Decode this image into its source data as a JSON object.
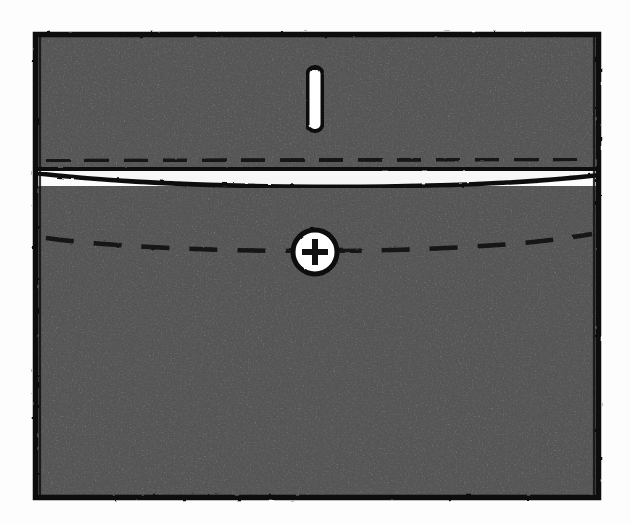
{
  "figure": {
    "title": "Sewing construction diagram: flap pocket with buttonhole and button",
    "style": "stippled line drawing",
    "background_color": "#fdfdfd",
    "ink_color": "#111111",
    "fabric_tone": "#b9b9b9",
    "highlight_color": "#f4f4f4"
  },
  "canvas": {
    "width": 631,
    "height": 523
  },
  "pocket": {
    "outline": {
      "label": "pocket-outline",
      "x": 33,
      "y": 32,
      "width": 568,
      "height": 468,
      "stroke_width": 5,
      "stroke_color": "#111111"
    },
    "flap": {
      "label": "pocket-flap",
      "top": 32,
      "fold_line_y": 170,
      "under_line_y": 192,
      "stitch_line_y": 160,
      "stroke_width": 4
    },
    "body": {
      "label": "pocket-body",
      "top": 192,
      "bottom": 500
    }
  },
  "stitching": {
    "left_seam": {
      "label": "left-edge-stitch-line",
      "x": 53,
      "y_start": 44,
      "y_end": 490,
      "dash": "16 13",
      "stroke_width": 4
    },
    "right_seam": {
      "label": "right-edge-stitch-line",
      "x": 581,
      "y_start": 44,
      "y_end": 490,
      "dash": "16 13",
      "stroke_width": 4
    },
    "flap_seam": {
      "label": "flap-stitch-line",
      "y": 160,
      "x_start": 44,
      "x_end": 592,
      "dash": "22 16",
      "stroke_width": 4
    },
    "button_seam": {
      "label": "button-stitch-line",
      "y": 248,
      "x_start": 44,
      "x_end": 592,
      "dash": "26 19",
      "stroke_width": 4,
      "sag": 10
    }
  },
  "buttonhole": {
    "label": "buttonhole",
    "center_x": 315,
    "center_y": 99,
    "width": 15,
    "height": 64,
    "corner_radius": 7,
    "stroke_width": 4,
    "fill": "#ffffff"
  },
  "button": {
    "label": "button",
    "center_x": 315,
    "center_y": 252,
    "radius": 22,
    "stroke_width": 5,
    "fill": "#ffffff",
    "mark": "plus",
    "mark_arm_length": 13,
    "mark_stroke_width": 6
  },
  "legend": {
    "parts": [
      {
        "name": "Flap",
        "note": "folded upper section with buttonhole"
      },
      {
        "name": "Buttonhole",
        "note": "vertical slot on flap"
      },
      {
        "name": "Button",
        "note": "round button with cross-stitch thread"
      },
      {
        "name": "Topstitching",
        "note": "dashed seam lines along edges"
      },
      {
        "name": "Pocket body",
        "note": "lower stippled fabric panel"
      }
    ]
  }
}
